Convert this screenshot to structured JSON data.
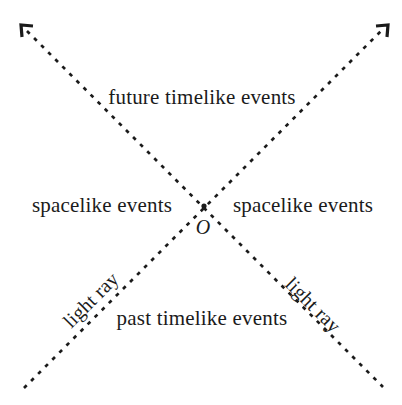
{
  "diagram": {
    "kind": "light-cone-spacetime-diagram",
    "labels": {
      "future": "future timelike events",
      "spacelike_left": "spacelike events",
      "spacelike_right": "spacelike events",
      "past": "past timelike events",
      "light_ray_left": "light ray",
      "light_ray_right": "light ray",
      "origin": "O"
    },
    "colors": {
      "ink": "#1b1b1b",
      "background": "#ffffff"
    }
  }
}
